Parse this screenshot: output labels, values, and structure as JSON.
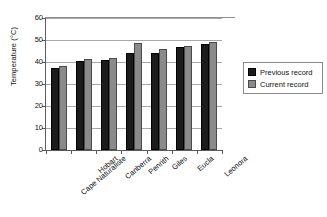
{
  "chart_data": {
    "type": "bar",
    "title": "",
    "xlabel": "",
    "ylabel": "Temperature (°C)",
    "ylim": [
      0,
      60
    ],
    "ytick_labels": [
      "60",
      "50",
      "40",
      "30",
      "20",
      "10",
      "0"
    ],
    "ytick_values": [
      60,
      50,
      40,
      30,
      20,
      10,
      0
    ],
    "grid": true,
    "legend_position": "right",
    "categories": [
      "Cape Naturaliste",
      "Hobart",
      "Canberra",
      "Penrith",
      "Giles",
      "Eucla",
      "Leonora"
    ],
    "series": [
      {
        "name": "Previous record",
        "color": "#1c1c1c",
        "values": [
          37.5,
          40.5,
          41,
          44,
          44,
          47,
          48
        ]
      },
      {
        "name": "Current record",
        "color": "#8a8a8a",
        "values": [
          38,
          41.5,
          42,
          48.5,
          46,
          47.5,
          49
        ]
      }
    ]
  },
  "legend": {
    "items": [
      {
        "label": "Previous record",
        "swatch": "previous-record-swatch"
      },
      {
        "label": "Current record",
        "swatch": "current-record-swatch"
      }
    ]
  }
}
